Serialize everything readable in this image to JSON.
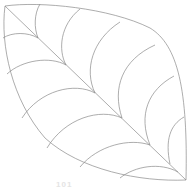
{
  "illustration": {
    "subject": "leaf outline with veins",
    "stroke_color": "#8a8a8a",
    "background": "#ffffff"
  },
  "watermark": {
    "text": "101"
  }
}
